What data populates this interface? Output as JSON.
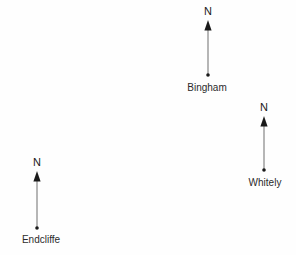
{
  "figure": {
    "background_color": "#fefefe",
    "line_color": "#6e6e6e",
    "marker_color": "#1a1a1a",
    "text_color": "#2b2b2b",
    "width": 296,
    "height": 255
  },
  "markers": [
    {
      "label": "Bingham",
      "north_label": "N",
      "icon": "north-arrow-icon",
      "point_x": 208,
      "point_y": 75,
      "tip_y": 20,
      "n_label_y": 6,
      "place_label_x": 207,
      "place_label_y": 82
    },
    {
      "label": "Whitely",
      "north_label": "N",
      "icon": "north-arrow-icon",
      "point_x": 264,
      "point_y": 170,
      "tip_y": 116,
      "n_label_y": 102,
      "place_label_x": 265,
      "place_label_y": 177
    },
    {
      "label": "Endcliffe",
      "north_label": "N",
      "icon": "north-arrow-icon",
      "point_x": 37,
      "point_y": 228,
      "tip_y": 171,
      "n_label_y": 157,
      "place_label_x": 41,
      "place_label_y": 234
    }
  ]
}
